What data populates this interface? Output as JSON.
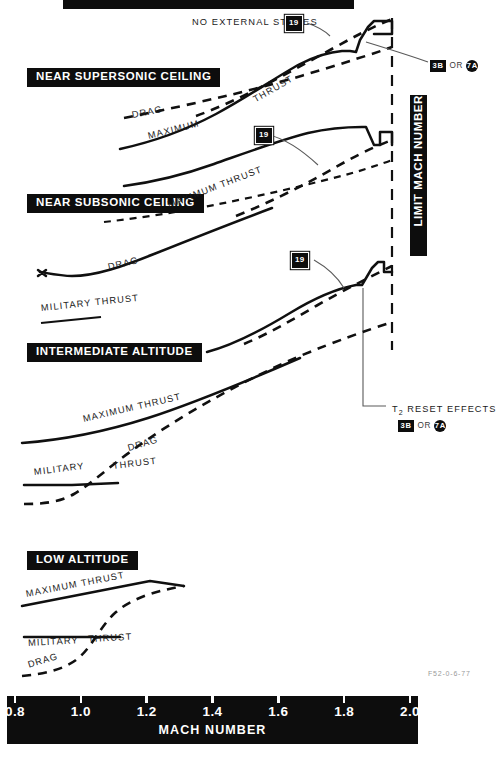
{
  "figure": {
    "top_banner_label": "",
    "figure_code": "F52-0-6-77"
  },
  "axis": {
    "title": "MACH NUMBER",
    "ticks": [
      "0.8",
      "1.0",
      "1.2",
      "1.4",
      "1.6",
      "1.8",
      "2.0"
    ],
    "range": [
      0.8,
      2.0
    ]
  },
  "limit_label": "LIMIT MACH NUMBER",
  "panels": [
    {
      "id": "near-supersonic-ceiling",
      "title": "NEAR SUPERSONIC CEILING",
      "notes": [
        "NO EXTERNAL STORES"
      ],
      "curve_labels": [
        "DRAG",
        "THRUST",
        "MAXIMUM"
      ],
      "callouts": [
        "19"
      ]
    },
    {
      "id": "near-subsonic-ceiling",
      "title": "NEAR SUBSONIC CEILING",
      "curve_labels": [
        "MAXIMUM THRUST",
        "DRAG",
        "MILITARY THRUST"
      ],
      "callouts": [
        "19"
      ]
    },
    {
      "id": "intermediate-altitude",
      "title": "INTERMEDIATE ALTITUDE",
      "curve_labels": [
        "MAXIMUM THRUST",
        "DRAG",
        "MILITARY",
        "THRUST"
      ],
      "callouts": [
        "19"
      ]
    },
    {
      "id": "low-altitude",
      "title": "LOW ALTITUDE",
      "curve_labels": [
        "MAXIMUM THRUST",
        "MILITARY",
        "THRUST",
        "DRAG"
      ],
      "callouts": []
    }
  ],
  "callouts": {
    "nineteen": "19",
    "or_word": "OR",
    "alt_square": "3B",
    "alt_circle": "7A",
    "t2_reset_label": "T",
    "t2_reset_sub": "2",
    "t2_reset_rest": " RESET EFFECTS"
  },
  "chart_data": {
    "type": "line",
    "xlabel": "MACH NUMBER",
    "ylabel": "",
    "xlim": [
      0.8,
      2.0
    ],
    "grid": false,
    "legend": "inline-curve-labels",
    "annotations": [
      "NO EXTERNAL STORES",
      "LIMIT MACH NUMBER",
      "T2 RESET EFFECTS",
      "3B OR 7A",
      "19"
    ],
    "panels": [
      {
        "name": "NEAR SUPERSONIC CEILING",
        "series": [
          {
            "name": "MAXIMUM THRUST (19 config, dashed)",
            "style": "dashed",
            "x": [
              1.16,
              1.3,
              1.45,
              1.6,
              1.75,
              1.88,
              1.95,
              2.0
            ],
            "y": [
              0.3,
              0.45,
              0.6,
              0.74,
              0.86,
              0.94,
              0.98,
              1.0
            ]
          },
          {
            "name": "MAXIMUM THRUST (solid, with T2 reset step)",
            "style": "solid",
            "x": [
              0.8,
              1.0,
              1.2,
              1.4,
              1.6,
              1.74,
              1.8,
              1.84,
              1.95,
              2.0
            ],
            "y": [
              0.0,
              0.1,
              0.24,
              0.42,
              0.58,
              0.64,
              0.62,
              0.86,
              0.94,
              0.92
            ]
          },
          {
            "name": "DRAG",
            "style": "dashed",
            "x": [
              0.8,
              1.0,
              1.15,
              1.3,
              1.5,
              1.7,
              1.9,
              2.0
            ],
            "y": [
              0.02,
              0.1,
              0.19,
              0.28,
              0.4,
              0.52,
              0.64,
              0.7
            ]
          }
        ]
      },
      {
        "name": "NEAR SUBSONIC CEILING",
        "series": [
          {
            "name": "MAXIMUM THRUST (19 config, dashed)",
            "style": "dashed",
            "x": [
              1.18,
              1.35,
              1.55,
              1.72,
              1.85,
              1.95,
              2.0
            ],
            "y": [
              0.18,
              0.34,
              0.52,
              0.66,
              0.78,
              0.86,
              0.9
            ]
          },
          {
            "name": "MAXIMUM THRUST (solid, with T2 reset step)",
            "style": "solid",
            "x": [
              0.95,
              1.15,
              1.35,
              1.55,
              1.72,
              1.8,
              1.86,
              1.95,
              2.0
            ],
            "y": [
              0.1,
              0.24,
              0.4,
              0.52,
              0.58,
              0.56,
              0.84,
              0.88,
              0.86
            ]
          },
          {
            "name": "DRAG",
            "style": "dashed",
            "x": [
              0.8,
              1.0,
              1.2,
              1.45,
              1.7,
              1.9,
              2.0
            ],
            "y": [
              0.0,
              0.08,
              0.2,
              0.34,
              0.5,
              0.64,
              0.7
            ]
          },
          {
            "name": "MILITARY THRUST",
            "style": "solid",
            "x": [
              0.8,
              1.0,
              1.25,
              1.5,
              1.75,
              2.0
            ],
            "y": [
              0.0,
              0.06,
              0.17,
              0.28,
              0.4,
              0.5
            ]
          }
        ]
      },
      {
        "name": "INTERMEDIATE ALTITUDE",
        "series": [
          {
            "name": "MAXIMUM THRUST (19 config, dashed)",
            "style": "dashed",
            "x": [
              1.2,
              1.4,
              1.6,
              1.78,
              1.9,
              2.0
            ],
            "y": [
              0.22,
              0.4,
              0.58,
              0.74,
              0.84,
              0.9
            ]
          },
          {
            "name": "MAXIMUM THRUST (solid, with T2 reset step)",
            "style": "solid",
            "x": [
              1.05,
              1.25,
              1.45,
              1.65,
              1.78,
              1.86,
              1.94,
              2.0
            ],
            "y": [
              0.06,
              0.24,
              0.42,
              0.56,
              0.6,
              0.86,
              0.9,
              0.86
            ]
          },
          {
            "name": "DRAG",
            "style": "dashed",
            "x": [
              0.8,
              0.95,
              1.05,
              1.2,
              1.45,
              1.7,
              1.9,
              2.0
            ],
            "y": [
              0.0,
              0.0,
              0.1,
              0.22,
              0.38,
              0.54,
              0.68,
              0.74
            ]
          },
          {
            "name": "MILITARY THRUST",
            "style": "solid",
            "x": [
              0.8,
              1.0,
              1.25,
              1.5,
              1.75,
              2.0
            ],
            "y": [
              0.12,
              0.18,
              0.3,
              0.42,
              0.54,
              0.64
            ]
          }
        ]
      },
      {
        "name": "LOW ALTITUDE",
        "series": [
          {
            "name": "MAXIMUM THRUST",
            "style": "solid",
            "x": [
              0.8,
              1.0,
              1.15,
              1.22,
              1.32
            ],
            "y": [
              0.55,
              0.72,
              0.84,
              0.9,
              0.82
            ]
          },
          {
            "name": "MILITARY THRUST",
            "style": "solid",
            "x": [
              0.8,
              1.0,
              1.15
            ],
            "y": [
              0.22,
              0.22,
              0.22
            ]
          },
          {
            "name": "DRAG",
            "style": "dashed",
            "x": [
              0.8,
              0.9,
              1.0,
              1.1,
              1.2,
              1.32
            ],
            "y": [
              0.04,
              0.06,
              0.2,
              0.56,
              0.76,
              0.82
            ]
          }
        ]
      }
    ]
  }
}
